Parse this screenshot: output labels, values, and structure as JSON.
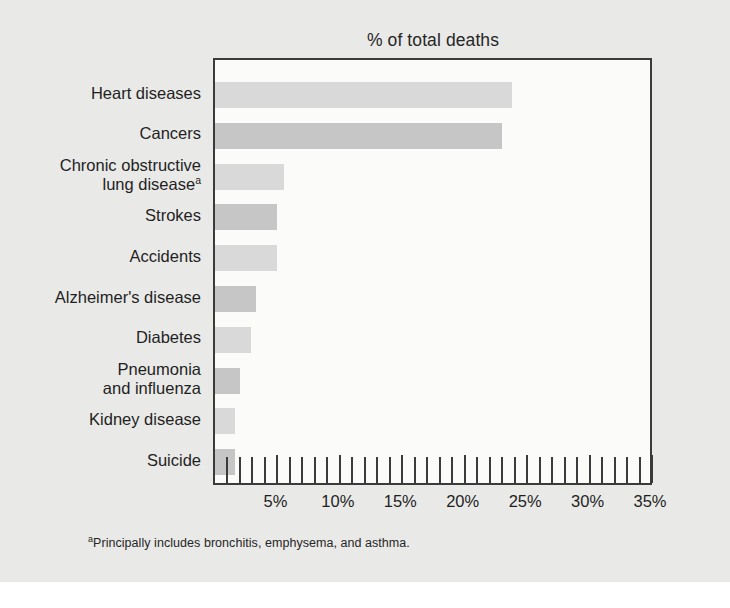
{
  "chart_data": {
    "type": "bar",
    "orientation": "horizontal",
    "title": "% of total deaths",
    "xlabel": "",
    "ylabel": "",
    "xlim": [
      0,
      35
    ],
    "grid": false,
    "legend": null,
    "tick_step": 5,
    "minor_tick_step": 1,
    "categories": [
      "Heart diseases",
      "Cancers",
      "Chronic obstructive\nlung disease",
      "Strokes",
      "Accidents",
      "Alzheimer's disease",
      "Diabetes",
      "Pneumonia\nand influenza",
      "Kidney disease",
      "Suicide"
    ],
    "values": [
      23.8,
      23.0,
      5.5,
      5.0,
      5.0,
      3.3,
      2.9,
      2.0,
      1.6,
      1.6
    ],
    "tick_labels": [
      "5%",
      "10%",
      "15%",
      "20%",
      "25%",
      "30%",
      "35%"
    ],
    "tick_values": [
      5,
      10,
      15,
      20,
      25,
      30,
      35
    ],
    "footnote_marker": "a",
    "footnote": "Principally includes bronchitis, emphysema, and asthma.",
    "colors": {
      "bar_light": "#d9d9d9",
      "bar_dark": "#c6c6c6",
      "frame": "#3b3b3b",
      "plot_background": "#fbfbfa",
      "figure_background": "#e9e9e7",
      "text": "#1f1f1f"
    }
  }
}
